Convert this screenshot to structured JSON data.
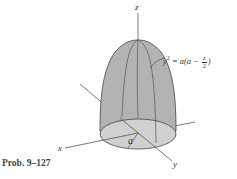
{
  "figure": {
    "caption": "Prob. 9–127",
    "axes": {
      "x": "x",
      "y": "y",
      "z": "z"
    },
    "dimension_label": "a",
    "equation": {
      "lhs": "y",
      "exp": "2",
      "rhs_prefix": "= a(a −",
      "frac_num": "z",
      "frac_den": "2",
      "rhs_suffix": ")"
    },
    "colors": {
      "dome_fill": "#b3b3b3",
      "base_fill": "#d0d0d0",
      "line": "#444444"
    }
  }
}
